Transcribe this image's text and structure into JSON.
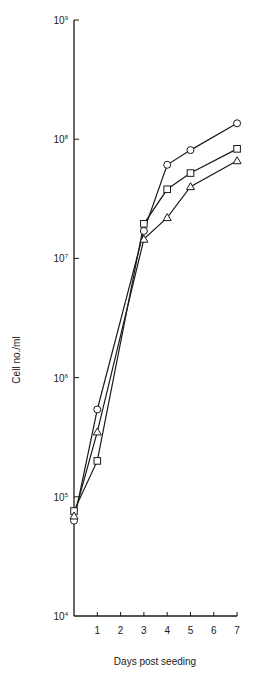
{
  "chart_data": {
    "type": "line",
    "title": "",
    "xlabel": "Days post seeding",
    "ylabel": "Cell no./ml",
    "yscale": "log",
    "ylim": [
      10000,
      1000000000
    ],
    "xlim": [
      0,
      7
    ],
    "x_ticks": [
      1,
      2,
      3,
      4,
      5,
      6,
      7
    ],
    "y_ticks": [
      {
        "value": 10000,
        "label_base": "10",
        "label_exp": "4"
      },
      {
        "value": 100000,
        "label_base": "10",
        "label_exp": "5"
      },
      {
        "value": 1000000,
        "label_base": "10",
        "label_exp": "6"
      },
      {
        "value": 10000000,
        "label_base": "10",
        "label_exp": "7"
      },
      {
        "value": 100000000,
        "label_base": "10",
        "label_exp": "8"
      },
      {
        "value": 1000000000,
        "label_base": "10",
        "label_exp": "9"
      }
    ],
    "grid": false,
    "legend": "none",
    "series": [
      {
        "name": "circle",
        "marker": "circle",
        "x": [
          0,
          1,
          3,
          4,
          5,
          7
        ],
        "values": [
          63000,
          540000,
          17000000,
          61000000,
          81000000,
          136000000
        ]
      },
      {
        "name": "square",
        "marker": "square",
        "x": [
          0,
          1,
          3,
          4,
          5,
          7
        ],
        "values": [
          76000,
          200000,
          19500000,
          38000000,
          52000000,
          83000000
        ]
      },
      {
        "name": "triangle",
        "marker": "triangle",
        "x": [
          0,
          1,
          3,
          4,
          5,
          7
        ],
        "values": [
          69000,
          350000,
          14500000,
          22000000,
          40000000,
          66000000
        ]
      }
    ]
  },
  "colors": {
    "line": "#1a1a1a",
    "marker_fill": "#ffffff",
    "background": "#ffffff"
  }
}
